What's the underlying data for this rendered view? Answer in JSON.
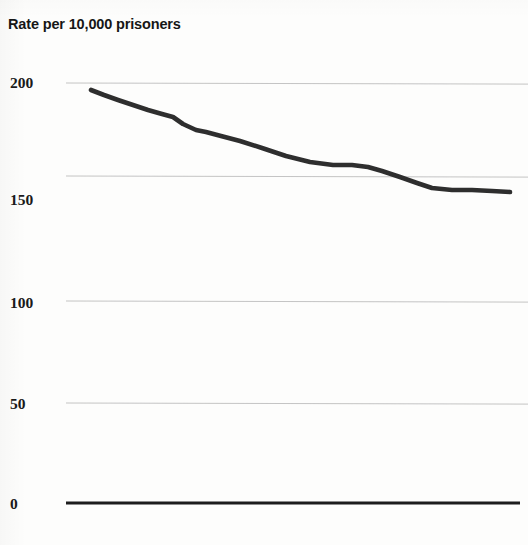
{
  "chart_data": {
    "type": "line",
    "title": "Rate per 10,000 prisoners",
    "subtitle": "",
    "xlabel": "",
    "ylabel": "Rate per 10,000 prisoners",
    "ylim": [
      0,
      200
    ],
    "yticks": [
      0,
      50,
      100,
      150,
      200
    ],
    "ytick_labels": [
      "0",
      "50",
      "100",
      "150",
      "200"
    ],
    "grid": "horizontal",
    "legend": "none",
    "series": [
      {
        "name": "Rate per 10,000 prisoners",
        "color": "#2b2b2b",
        "values": [
          194,
          190,
          185,
          180,
          177,
          176,
          174,
          172,
          169,
          166,
          164,
          163,
          160,
          157,
          155,
          155,
          154,
          153
        ],
        "x": [
          0,
          1,
          2,
          3,
          4,
          5,
          6,
          7,
          8,
          9,
          10,
          11,
          12,
          13,
          14,
          15,
          16,
          17
        ]
      }
    ],
    "axis_baseline_value": 0,
    "annotations": []
  },
  "titles": {
    "axis_title": "Rate per 10,000 prisoners"
  },
  "axis": {
    "ticks": [
      {
        "label": "200",
        "value": 200,
        "y_px": 75
      },
      {
        "label": "150",
        "value": 150,
        "y_px": 192
      },
      {
        "label": "100",
        "value": 100,
        "y_px": 295
      },
      {
        "label": "50",
        "value": 50,
        "y_px": 396
      },
      {
        "label": "0",
        "value": 0,
        "y_px": 496
      }
    ]
  },
  "gridlines": {
    "y_px": [
      83,
      176,
      301,
      403,
      503
    ],
    "color": "#b9b9b9",
    "baseline_color": "#1d1d1d"
  },
  "colors": {
    "line": "#2e2e2e",
    "grid": "#b9b9b9",
    "baseline": "#1d1d1d",
    "text": "#171717",
    "background": "#fdfdfc"
  },
  "plot_geometry": {
    "left_px": 66,
    "right_px": 520,
    "line_points_px": [
      [
        91,
        90
      ],
      [
        104,
        95
      ],
      [
        118,
        100
      ],
      [
        133,
        105
      ],
      [
        148,
        110
      ],
      [
        162,
        114
      ],
      [
        173,
        117
      ],
      [
        183,
        124
      ],
      [
        196,
        130
      ],
      [
        206,
        132
      ],
      [
        221,
        136
      ],
      [
        240,
        141
      ],
      [
        262,
        148
      ],
      [
        286,
        156
      ],
      [
        310,
        162
      ],
      [
        333,
        165
      ],
      [
        352,
        165
      ],
      [
        368,
        167
      ],
      [
        382,
        171
      ],
      [
        400,
        177
      ],
      [
        417,
        183
      ],
      [
        432,
        188
      ],
      [
        452,
        190
      ],
      [
        472,
        190
      ],
      [
        492,
        191
      ],
      [
        510,
        192
      ]
    ]
  }
}
